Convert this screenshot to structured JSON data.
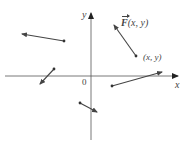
{
  "diagram": {
    "colors": {
      "axis": "#555555",
      "vector": "#444444",
      "text": "#444444",
      "background": "#ffffff"
    },
    "axes": {
      "x_label": "x",
      "y_label": "y",
      "origin_label": "0",
      "origin": [
        91,
        76
      ],
      "x_range_px": [
        5,
        178
      ],
      "y_range_px": [
        13,
        140
      ]
    },
    "vectors": [
      {
        "name": "vector-upper-left",
        "base": [
          64,
          41
        ],
        "tip": [
          21,
          34
        ]
      },
      {
        "name": "vector-left-down",
        "base": [
          54,
          69
        ],
        "tip": [
          39,
          85
        ]
      },
      {
        "name": "vector-below-origin",
        "base": [
          80,
          103
        ],
        "tip": [
          98,
          113
        ]
      },
      {
        "name": "vector-right-long",
        "base": [
          112,
          86
        ],
        "tip": [
          163,
          72
        ]
      },
      {
        "name": "vector-F",
        "base": [
          136,
          56
        ],
        "tip": [
          113,
          24
        ],
        "label": "F(x, y)",
        "base_label": "(x, y)"
      }
    ],
    "labels": {
      "F_symbol": "F",
      "F_args": "(x, y)",
      "point_label": "(x, y)"
    }
  }
}
